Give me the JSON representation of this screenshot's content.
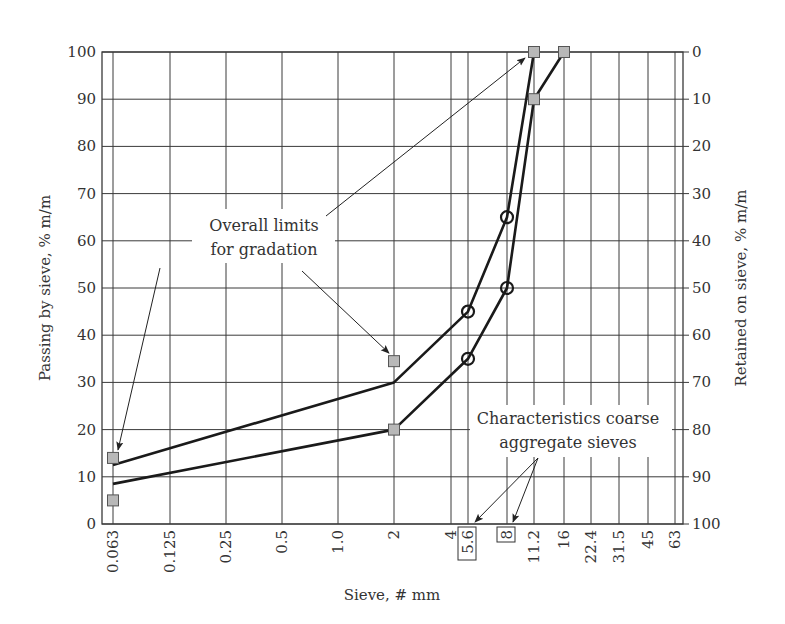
{
  "chart_data": {
    "type": "line",
    "title": "",
    "xlabel": "Sieve, # mm",
    "ylabel": "Passing by sieve, % m/m",
    "ylabel_right": "Retained on sieve, % m/m",
    "x_scale": "categorical (sieve sizes, log-like spacing)",
    "categories": [
      "0.063",
      "0.125",
      "0.25",
      "0.5",
      "1.0",
      "2",
      "4",
      "5.6",
      "8",
      "11.2",
      "16",
      "22.4",
      "31.5",
      "45",
      "63"
    ],
    "highlighted_categories": [
      "5.6",
      "8"
    ],
    "y_ticks": [
      0,
      10,
      20,
      30,
      40,
      50,
      60,
      70,
      80,
      90,
      100
    ],
    "y_right_ticks": [
      100,
      90,
      80,
      70,
      60,
      50,
      40,
      30,
      20,
      10,
      0
    ],
    "ylim": [
      0,
      100
    ],
    "grid": true,
    "series": [
      {
        "name": "Upper grading curve",
        "points": [
          {
            "x": "0.063",
            "y": 12.5
          },
          {
            "x": "2",
            "y": 30
          },
          {
            "x": "5.6",
            "y": 45,
            "marker": "circle"
          },
          {
            "x": "8",
            "y": 65,
            "marker": "circle"
          },
          {
            "x": "11.2",
            "y": 100
          }
        ]
      },
      {
        "name": "Lower grading curve",
        "points": [
          {
            "x": "0.063",
            "y": 8.5
          },
          {
            "x": "2",
            "y": 20
          },
          {
            "x": "5.6",
            "y": 35,
            "marker": "circle"
          },
          {
            "x": "8",
            "y": 50,
            "marker": "circle"
          },
          {
            "x": "11.2",
            "y": 90
          },
          {
            "x": "16",
            "y": 100
          }
        ]
      },
      {
        "name": "Overall limits for gradation",
        "marker": "square",
        "points": [
          {
            "x": "0.063",
            "y": 14
          },
          {
            "x": "0.063",
            "y": 5
          },
          {
            "x": "2",
            "y": 34.5
          },
          {
            "x": "2",
            "y": 20
          },
          {
            "x": "11.2",
            "y": 100
          },
          {
            "x": "11.2",
            "y": 90
          },
          {
            "x": "16",
            "y": 100
          }
        ]
      }
    ],
    "annotations": [
      {
        "text": [
          "Overall limits",
          "for gradation"
        ],
        "arrows_to": [
          {
            "x": "0.063",
            "y": 14
          },
          {
            "x": "2",
            "y": 34.5
          },
          {
            "x": "11.2",
            "y": 100
          }
        ]
      },
      {
        "text": [
          "Characteristics coarse",
          "aggregate sieves"
        ],
        "arrows_to": [
          {
            "x": "5.6",
            "y": 0
          },
          {
            "x": "8",
            "y": 0
          }
        ]
      }
    ]
  },
  "layout": {
    "plot": {
      "left": 102,
      "right": 683,
      "top": 52,
      "bottom": 524
    },
    "x_positions": [
      113,
      170,
      226,
      282,
      338,
      394,
      451,
      468,
      507,
      534,
      564,
      591,
      619,
      648,
      675
    ],
    "colors": {
      "line": "#1a1a1a",
      "grid": "#3a3a3a",
      "marker_fill": "#b8b8b8",
      "marker_stroke": "#555555",
      "text": "#333333"
    }
  }
}
